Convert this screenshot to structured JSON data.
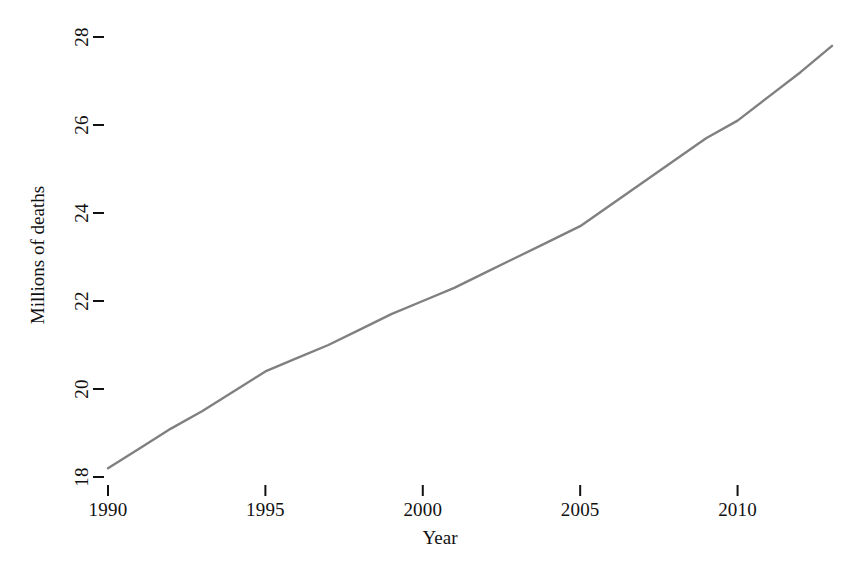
{
  "chart_data": {
    "type": "line",
    "title": "",
    "xlabel": "Year",
    "ylabel": "Millions of deaths",
    "xlim": [
      1990,
      2013
    ],
    "ylim": [
      18,
      28
    ],
    "grid": false,
    "legend": null,
    "line_color": "#808080",
    "x": [
      1990,
      1995,
      2000,
      2005,
      2010,
      2013
    ],
    "values": [
      18.2,
      20.4,
      22.0,
      23.7,
      26.1,
      27.8
    ],
    "series": [
      {
        "name": "Total deaths",
        "color": "#808080",
        "points": [
          {
            "x": 1990,
            "y": 18.2
          },
          {
            "x": 1991,
            "y": 18.65
          },
          {
            "x": 1992,
            "y": 19.1
          },
          {
            "x": 1993,
            "y": 19.5
          },
          {
            "x": 1994,
            "y": 19.95
          },
          {
            "x": 1995,
            "y": 20.4
          },
          {
            "x": 1996,
            "y": 20.7
          },
          {
            "x": 1997,
            "y": 21.0
          },
          {
            "x": 1998,
            "y": 21.35
          },
          {
            "x": 1999,
            "y": 21.7
          },
          {
            "x": 2000,
            "y": 22.0
          },
          {
            "x": 2001,
            "y": 22.3
          },
          {
            "x": 2002,
            "y": 22.65
          },
          {
            "x": 2003,
            "y": 23.0
          },
          {
            "x": 2004,
            "y": 23.35
          },
          {
            "x": 2005,
            "y": 23.7
          },
          {
            "x": 2006,
            "y": 24.2
          },
          {
            "x": 2007,
            "y": 24.7
          },
          {
            "x": 2008,
            "y": 25.2
          },
          {
            "x": 2009,
            "y": 25.7
          },
          {
            "x": 2010,
            "y": 26.1
          },
          {
            "x": 2011,
            "y": 26.65
          },
          {
            "x": 2012,
            "y": 27.2
          },
          {
            "x": 2013,
            "y": 27.8
          }
        ]
      }
    ],
    "x_ticks": [
      {
        "value": 1990,
        "label": "1990"
      },
      {
        "value": 1995,
        "label": "1995"
      },
      {
        "value": 2000,
        "label": "2000"
      },
      {
        "value": 2005,
        "label": "2005"
      },
      {
        "value": 2010,
        "label": "2010"
      }
    ],
    "y_ticks": [
      {
        "value": 18,
        "label": "18"
      },
      {
        "value": 20,
        "label": "20"
      },
      {
        "value": 22,
        "label": "22"
      },
      {
        "value": 24,
        "label": "24"
      },
      {
        "value": 26,
        "label": "26"
      },
      {
        "value": 28,
        "label": "28"
      }
    ]
  },
  "axes": {
    "x_title": "Year",
    "y_title": "Millions of deaths"
  },
  "ticks": {
    "x": [
      "1990",
      "1995",
      "2000",
      "2005",
      "2010"
    ],
    "y": [
      "18",
      "20",
      "22",
      "24",
      "26",
      "28"
    ]
  }
}
